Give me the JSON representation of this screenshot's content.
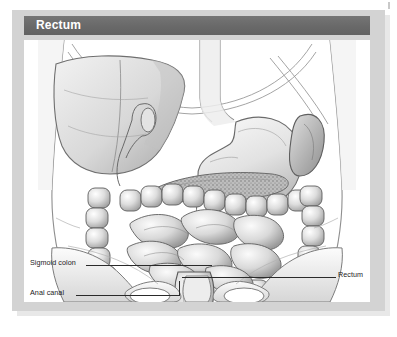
{
  "figure": {
    "title": "Rectum",
    "type": "anatomical-illustration",
    "style": "grayscale pencil rendering"
  },
  "labels": [
    {
      "id": "sigmoid",
      "text": "Sigmoid colon",
      "side": "left"
    },
    {
      "id": "anal",
      "text": "Anal canal",
      "side": "left"
    },
    {
      "id": "rectum",
      "text": "Rectum",
      "side": "right"
    }
  ],
  "colors": {
    "title_bar": "#6e6e6e",
    "title_text": "#ffffff",
    "frame": "#d3d3d3",
    "panel": "#ffffff",
    "leader_line": "#2a2a2a",
    "organ_outline": "#4a4a4a",
    "organ_fill": "#e9e9e9"
  }
}
